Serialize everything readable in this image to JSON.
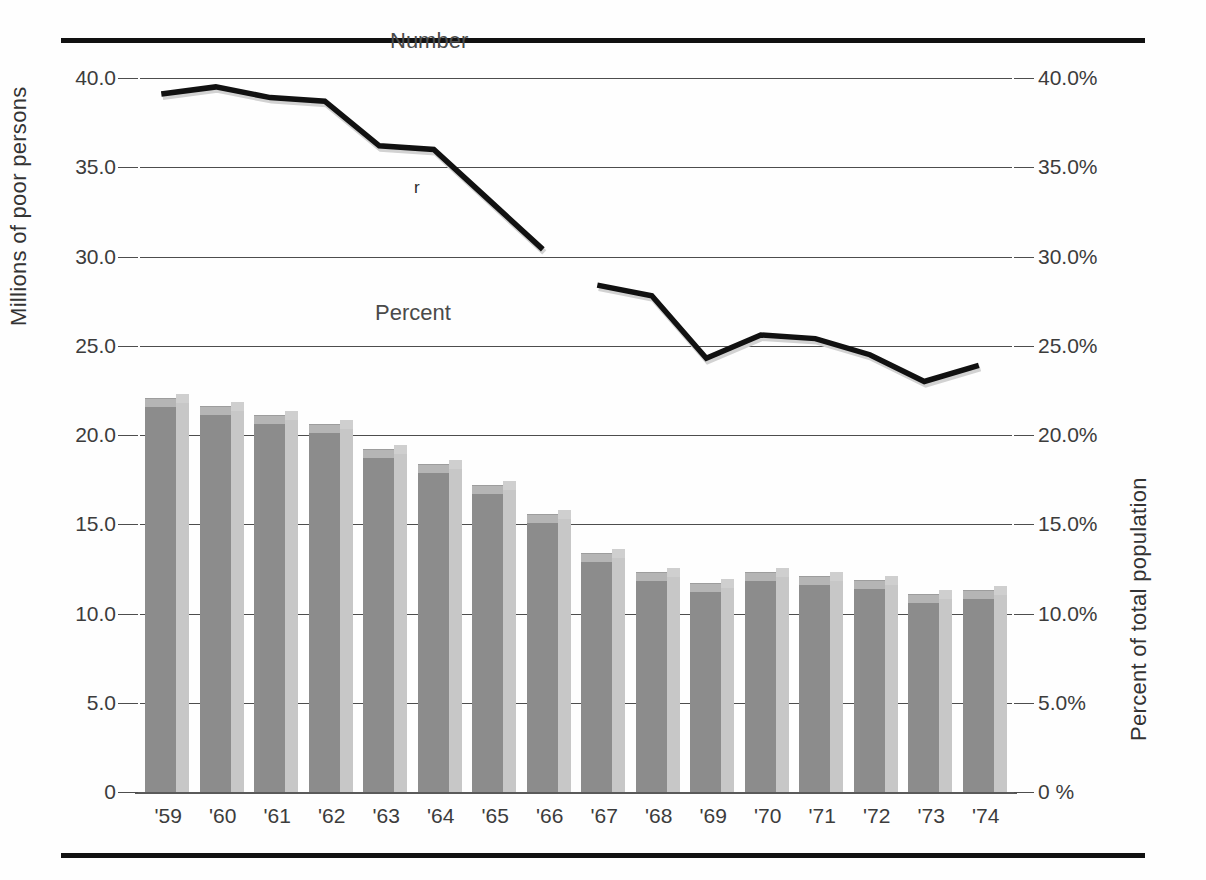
{
  "figure": {
    "left_axis_title": "Millions of  poor persons",
    "right_axis_title": "Percent of total population",
    "number_series_label": "Number",
    "percent_series_label": "Percent",
    "revision_mark": "r"
  },
  "chart_data": {
    "type": "bar",
    "title": "",
    "subtitle": "",
    "xlabel": "",
    "ylabel": "Millions of  poor persons",
    "y2label": "Percent of total population",
    "grid": true,
    "legend_position": "inline-annotations",
    "categories": [
      "'59",
      "'60",
      "'61",
      "'62",
      "'63",
      "'64",
      "'65",
      "'66",
      "'67",
      "'68",
      "'69",
      "'70",
      "'71",
      "'72",
      "'73",
      "'74"
    ],
    "ylim": [
      0,
      40
    ],
    "y2lim": [
      0,
      40
    ],
    "yticks": [
      "0",
      "5.0",
      "10.0",
      "15.0",
      "20.0",
      "25.0",
      "30.0",
      "35.0",
      "40.0"
    ],
    "y2ticks": [
      "0 %",
      "5.0%",
      "10.0%",
      "15.0%",
      "20.0%",
      "25.0%",
      "30.0%",
      "35.0%",
      "40.0%"
    ],
    "series": [
      {
        "name": "Percent",
        "type": "bar",
        "axis": "right",
        "unit": "percent of total population",
        "values": [
          22.1,
          21.6,
          21.1,
          20.6,
          19.2,
          18.4,
          17.2,
          15.6,
          13.4,
          12.3,
          11.7,
          12.3,
          12.1,
          11.9,
          11.1,
          11.3
        ]
      },
      {
        "name": "Number",
        "type": "line",
        "axis": "left",
        "unit": "millions of poor persons",
        "break_after_category": "'66",
        "values": [
          39.1,
          39.5,
          38.9,
          38.7,
          36.2,
          36.0,
          33.2,
          30.4,
          28.4,
          27.8,
          24.3,
          25.6,
          25.4,
          24.5,
          23.0,
          23.9
        ],
        "segments": [
          {
            "name": "pre-revision",
            "categories": [
              "'59",
              "'60",
              "'61",
              "'62",
              "'63",
              "'64",
              "'65",
              "'66"
            ],
            "values": [
              39.1,
              39.5,
              38.9,
              38.7,
              36.2,
              36.0,
              33.2,
              30.4
            ]
          },
          {
            "name": "post-revision",
            "categories": [
              "'67",
              "'68",
              "'69",
              "'70",
              "'71",
              "'72",
              "'73",
              "'74"
            ],
            "values": [
              28.4,
              27.8,
              24.3,
              25.6,
              25.4,
              24.5,
              23.0,
              23.9
            ]
          }
        ]
      }
    ],
    "colors": {
      "bar_front": "#8c8c8c",
      "bar_side": "#c7c7c7",
      "bar_top": "#b5b5b5",
      "line": "#111111",
      "grid": "#4d4d4d",
      "rule": "#111111",
      "text": "#3c3c3c"
    }
  }
}
